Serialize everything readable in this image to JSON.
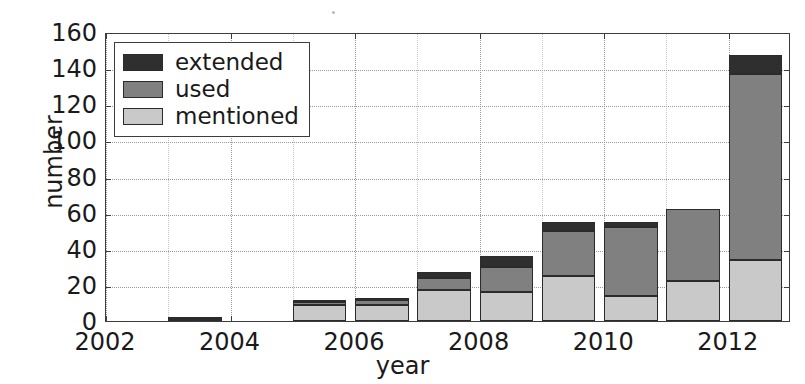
{
  "chart_data": {
    "type": "bar",
    "subtype": "stacked-vertical",
    "title": "",
    "subtitle": "",
    "xlabel": "year",
    "ylabel": "number",
    "categories": [
      2002,
      2003,
      2004,
      2005,
      2006,
      2007,
      2008,
      2009,
      2010,
      2011,
      2012
    ],
    "xtick_labels": [
      "2002",
      "2004",
      "2006",
      "2008",
      "2010",
      "2012"
    ],
    "xtick_values": [
      2002,
      2004,
      2006,
      2008,
      2010,
      2012
    ],
    "ytick_labels": [
      "0",
      "20",
      "40",
      "60",
      "80",
      "100",
      "120",
      "140",
      "160"
    ],
    "ytick_values": [
      0,
      20,
      40,
      60,
      80,
      100,
      120,
      140,
      160
    ],
    "xlim": [
      2002,
      2013
    ],
    "ylim": [
      0,
      160
    ],
    "grid": true,
    "grid_style": "dotted",
    "legend_position": "upper left",
    "series": [
      {
        "name": "mentioned",
        "color": "#c9c9c9",
        "values": [
          0,
          0,
          0,
          9,
          9,
          17,
          16,
          25,
          14,
          22,
          34
        ]
      },
      {
        "name": "used",
        "color": "#808080",
        "values": [
          0,
          1,
          0,
          1.5,
          2.5,
          7,
          14,
          25,
          38,
          40,
          103
        ]
      },
      {
        "name": "extended",
        "color": "#2f2f2f",
        "values": [
          0,
          1,
          0,
          0.5,
          1,
          3,
          6,
          5,
          3,
          0,
          10
        ]
      }
    ],
    "totals": [
      0,
      2,
      0,
      11,
      12.5,
      27,
      36,
      55,
      55,
      62,
      147
    ],
    "annotations": []
  },
  "legend": {
    "items": [
      {
        "label": "extended",
        "color": "#2f2f2f",
        "swatch": "legend-swatch-extended"
      },
      {
        "label": "used",
        "color": "#808080",
        "swatch": "legend-swatch-used"
      },
      {
        "label": "mentioned",
        "color": "#c9c9c9",
        "swatch": "legend-swatch-mentioned"
      }
    ]
  },
  "axes": {
    "y_title": "number",
    "x_title": "year"
  },
  "colors": {
    "extended": "#2f2f2f",
    "used": "#808080",
    "mentioned": "#c9c9c9",
    "axis": "#3d3d3d",
    "grid": "#9a9a9a",
    "text": "#1a1a1a",
    "background": "#ffffff"
  }
}
